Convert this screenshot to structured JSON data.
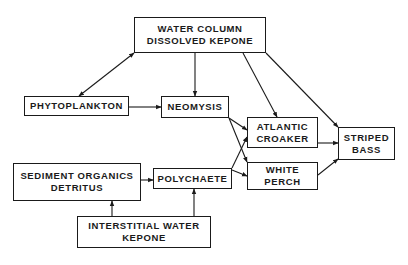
{
  "diagram": {
    "title": "",
    "nodes": {
      "water_column": {
        "line1": "WATER COLUMN",
        "line2": "DISSOLVED KEPONE"
      },
      "phytoplankton": {
        "line1": "PHYTOPLANKTON"
      },
      "neomysis": {
        "line1": "NEOMYSIS"
      },
      "atlantic_croaker": {
        "line1": "ATLANTIC",
        "line2": "CROAKER"
      },
      "striped_bass": {
        "line1": "STRIPED",
        "line2": "BASS"
      },
      "white_perch": {
        "line1": "WHITE",
        "line2": "PERCH"
      },
      "sediment": {
        "line1": "SEDIMENT ORGANICS",
        "line2": "DETRITUS"
      },
      "polychaete": {
        "line1": "POLYCHAETE"
      },
      "interstitial": {
        "line1": "INTERSTITIAL WATER",
        "line2": "KEPONE"
      }
    },
    "edges": [
      {
        "from": "WATER COLUMN DISSOLVED KEPONE",
        "to": "PHYTOPLANKTON",
        "bidirectional": true
      },
      {
        "from": "WATER COLUMN DISSOLVED KEPONE",
        "to": "NEOMYSIS"
      },
      {
        "from": "WATER COLUMN DISSOLVED KEPONE",
        "to": "ATLANTIC CROAKER"
      },
      {
        "from": "WATER COLUMN DISSOLVED KEPONE",
        "to": "STRIPED BASS"
      },
      {
        "from": "PHYTOPLANKTON",
        "to": "NEOMYSIS"
      },
      {
        "from": "NEOMYSIS",
        "to": "ATLANTIC CROAKER"
      },
      {
        "from": "NEOMYSIS",
        "to": "WHITE PERCH"
      },
      {
        "from": "POLYCHAETE",
        "to": "ATLANTIC CROAKER"
      },
      {
        "from": "POLYCHAETE",
        "to": "WHITE PERCH"
      },
      {
        "from": "ATLANTIC CROAKER",
        "to": "STRIPED BASS"
      },
      {
        "from": "WHITE PERCH",
        "to": "STRIPED BASS"
      },
      {
        "from": "SEDIMENT ORGANICS DETRITUS",
        "to": "POLYCHAETE"
      },
      {
        "from": "INTERSTITIAL WATER KEPONE",
        "to": "SEDIMENT ORGANICS DETRITUS"
      },
      {
        "from": "INTERSTITIAL WATER KEPONE",
        "to": "POLYCHAETE"
      }
    ],
    "colors": {
      "ink": "#1a1a1a",
      "background": "#ffffff"
    }
  }
}
